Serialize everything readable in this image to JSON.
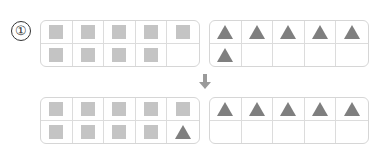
{
  "problem": {
    "number_label": "①"
  },
  "colors": {
    "square": "#c4c4c4",
    "triangle": "#7f7f7f",
    "frame_border": "#d6d6d6",
    "arrow": "#9a9a9a"
  },
  "before": {
    "left_frame": {
      "cells": [
        "square",
        "square",
        "square",
        "square",
        "square",
        "square",
        "square",
        "square",
        "square",
        "empty"
      ]
    },
    "right_frame": {
      "cells": [
        "triangle",
        "triangle",
        "triangle",
        "triangle",
        "triangle",
        "triangle",
        "empty",
        "empty",
        "empty",
        "empty"
      ]
    }
  },
  "arrow": {
    "direction": "down"
  },
  "after": {
    "left_frame": {
      "cells": [
        "square",
        "square",
        "square",
        "square",
        "square",
        "square",
        "square",
        "square",
        "square",
        "triangle"
      ]
    },
    "right_frame": {
      "cells": [
        "triangle",
        "triangle",
        "triangle",
        "triangle",
        "triangle",
        "empty",
        "empty",
        "empty",
        "empty",
        "empty"
      ]
    }
  }
}
